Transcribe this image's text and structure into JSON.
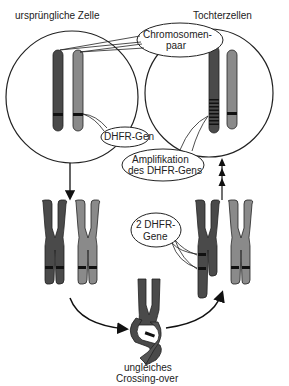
{
  "labels": {
    "original_cell": "ursprüngliche Zelle",
    "daughter_cells": "Tochterzellen",
    "chromosome_pair_line1": "Chromosomen-",
    "chromosome_pair_line2": "paar",
    "dhfr_gene": "DHFR-Gen",
    "amplification_line1": "Amplifikation",
    "amplification_line2": "des DHFR-Gens",
    "two_dhfr_line1": "2 DHFR-",
    "two_dhfr_line2": "Gene",
    "crossing_line1": "ungleiches",
    "crossing_line2": "Crossing-over"
  },
  "colors": {
    "dark_chromosome": "#4a4a4a",
    "light_chromosome": "#8a8a8a",
    "band": "#111111",
    "outline": "#222222"
  }
}
